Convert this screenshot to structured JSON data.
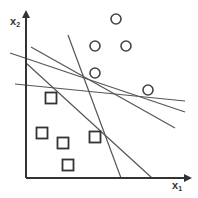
{
  "diagram": {
    "title": "",
    "colors": {
      "stroke": "#444444",
      "axis": "#333333",
      "background": "#ffffff"
    },
    "axes": {
      "x": {
        "label": "x",
        "subscript": "1",
        "from": [
          26,
          178
        ],
        "to": [
          190,
          178
        ]
      },
      "y": {
        "label": "x",
        "subscript": "2",
        "from": [
          26,
          178
        ],
        "to": [
          26,
          12
        ]
      }
    },
    "circles": [
      {
        "cx": 116,
        "cy": 19
      },
      {
        "cx": 95,
        "cy": 46
      },
      {
        "cx": 126,
        "cy": 46
      },
      {
        "cx": 95,
        "cy": 73
      },
      {
        "cx": 148,
        "cy": 90
      }
    ],
    "squares": [
      {
        "cx": 51,
        "cy": 98
      },
      {
        "cx": 42,
        "cy": 133
      },
      {
        "cx": 63,
        "cy": 143
      },
      {
        "cx": 95,
        "cy": 137
      },
      {
        "cx": 68,
        "cy": 165
      }
    ],
    "lines": [
      {
        "x1": 68,
        "y1": 35,
        "x2": 121,
        "y2": 178
      },
      {
        "x1": 26,
        "y1": 63,
        "x2": 152,
        "y2": 178
      },
      {
        "x1": 31,
        "y1": 47,
        "x2": 175,
        "y2": 128
      },
      {
        "x1": 10,
        "y1": 53,
        "x2": 185,
        "y2": 112
      },
      {
        "x1": 15,
        "y1": 84,
        "x2": 185,
        "y2": 101
      }
    ]
  }
}
